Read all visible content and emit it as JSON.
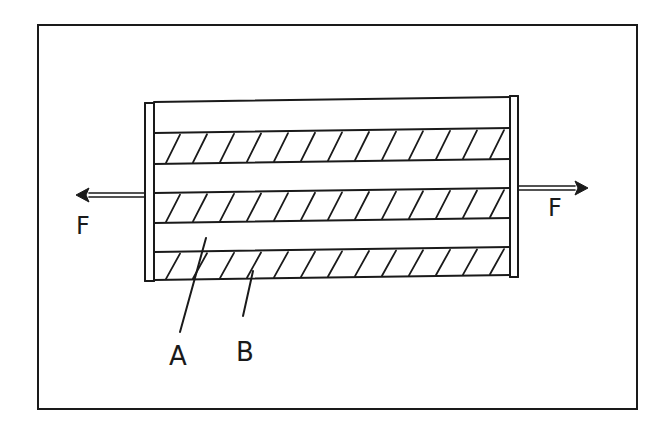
{
  "figure": {
    "background": "#ffffff",
    "ink_color": "#1a1a1a",
    "frame": {
      "x1": 38,
      "y1": 25,
      "x2": 637,
      "y2": 409
    }
  },
  "composite": {
    "left_edge": {
      "outer_x": 145,
      "inner_x": 154,
      "top_y": 103,
      "bottom_y": 281
    },
    "right_edge": {
      "inner_x": 510,
      "outer_x": 518,
      "top_y": 96,
      "bottom_y": 277
    },
    "tilt_px": 5,
    "body_top_left_y": 102,
    "body_bottom_left_y": 280,
    "layers": [
      {
        "name": "A",
        "type": "plain",
        "top": 102,
        "bottom": 133
      },
      {
        "name": "B",
        "type": "hatched",
        "top": 133,
        "bottom": 164
      },
      {
        "name": "A",
        "type": "plain",
        "top": 164,
        "bottom": 193
      },
      {
        "name": "B",
        "type": "hatched",
        "top": 193,
        "bottom": 223
      },
      {
        "name": "A",
        "type": "plain",
        "top": 223,
        "bottom": 252
      },
      {
        "name": "B",
        "type": "hatched",
        "top": 252,
        "bottom": 280
      }
    ],
    "hatch_spacing": 27,
    "hatch_slant": 14
  },
  "forces": [
    {
      "label": "F",
      "direction": "left",
      "tip_x": 76,
      "tail_x": 145,
      "y": 195,
      "label_x": 76,
      "label_y": 234
    },
    {
      "label": "F",
      "direction": "right",
      "tip_x": 588,
      "tail_x": 519,
      "y": 188,
      "label_x": 548,
      "label_y": 216
    }
  ],
  "callouts": [
    {
      "label": "A",
      "label_x": 169,
      "label_y": 365,
      "line": [
        180,
        332,
        206,
        238
      ]
    },
    {
      "label": "B",
      "label_x": 236,
      "label_y": 361,
      "line": [
        243,
        316,
        253,
        271
      ]
    }
  ],
  "labels": {
    "force_left": "F",
    "force_right": "F",
    "material_a": "A",
    "material_b": "B"
  }
}
